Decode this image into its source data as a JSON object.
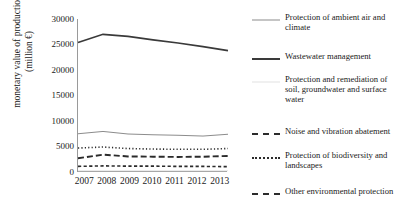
{
  "chart_data": {
    "type": "line",
    "title": "",
    "xlabel": "",
    "ylabel": "monetary value of production\n(million €)",
    "categories": [
      "2007",
      "2008",
      "2009",
      "2010",
      "2011",
      "2012",
      "2013"
    ],
    "ylim": [
      0,
      30000
    ],
    "ytick_labels": [
      "30000",
      "25000",
      "20000",
      "15000",
      "10000",
      "5000",
      "0"
    ],
    "ytick_values": [
      30000,
      25000,
      20000,
      15000,
      10000,
      5000,
      0
    ],
    "grid": false,
    "legend_position": "right",
    "series": [
      {
        "name": "Protection of ambient air and climate",
        "style": "solid-thin-gray",
        "color": "#8c8c8c",
        "values": [
          7500,
          7950,
          7450,
          7300,
          7200,
          7050,
          7400
        ]
      },
      {
        "name": "Wastewater management",
        "style": "solid-thick-black",
        "color": "#3a3a3a",
        "values": [
          25400,
          27000,
          26600,
          25900,
          25300,
          24600,
          23800
        ]
      },
      {
        "name": "Protection and remediation of soil, groundwater and surface water",
        "style": "solid-faint-gray",
        "color": "#e2e2e2",
        "values": [
          250,
          250,
          250,
          250,
          250,
          250,
          250
        ]
      },
      {
        "name": "Noise and vibration abatement",
        "style": "dashed-long-black",
        "color": "#2b2b2b",
        "values": [
          2700,
          3400,
          3050,
          3000,
          2950,
          3000,
          3150
        ]
      },
      {
        "name": "Protection of biodiversity and landscapes",
        "style": "dotted-black",
        "color": "#2b2b2b",
        "values": [
          4700,
          4900,
          4600,
          4500,
          4450,
          4450,
          4600
        ]
      },
      {
        "name": "Other environmental protection",
        "style": "dashed-short-black",
        "color": "#2b2b2b",
        "values": [
          1100,
          1200,
          1150,
          1150,
          1100,
          1100,
          1050
        ]
      }
    ]
  }
}
